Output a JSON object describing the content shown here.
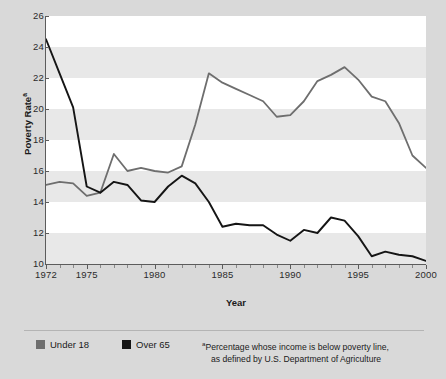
{
  "chart_data": {
    "type": "line",
    "title": "",
    "xlabel": "Year",
    "ylabel": "Poverty Rate",
    "ylabel_superscript": "a",
    "xlim": [
      1972,
      2000
    ],
    "ylim": [
      10,
      26
    ],
    "y_ticks": [
      26,
      24,
      22,
      20,
      18,
      16,
      14,
      12,
      10
    ],
    "x_ticks": [
      1972,
      1975,
      1980,
      1985,
      1990,
      1995,
      2000
    ],
    "x_minor_tick_interval": 1,
    "grid": "alternating-horizontal-bands",
    "legend_position": "bottom-left",
    "x": [
      1972,
      1973,
      1974,
      1975,
      1976,
      1977,
      1978,
      1979,
      1980,
      1981,
      1982,
      1983,
      1984,
      1985,
      1986,
      1987,
      1988,
      1989,
      1990,
      1991,
      1992,
      1993,
      1994,
      1995,
      1996,
      1997,
      1998,
      1999,
      2000
    ],
    "series": [
      {
        "name": "Under 18",
        "color": "#6e6e6e",
        "values": [
          15.1,
          15.3,
          15.2,
          14.4,
          14.6,
          17.1,
          16.0,
          16.2,
          16.0,
          15.9,
          16.3,
          19.0,
          22.3,
          21.7,
          21.3,
          20.9,
          20.5,
          19.5,
          19.6,
          20.5,
          21.8,
          22.2,
          22.7,
          21.9,
          20.8,
          20.5,
          19.1,
          17.0,
          16.2
        ]
      },
      {
        "name": "Over 65",
        "color": "#151515",
        "values": [
          24.5,
          22.3,
          20.1,
          15.0,
          14.6,
          15.3,
          15.1,
          14.1,
          14.0,
          15.0,
          15.7,
          15.2,
          14.0,
          12.4,
          12.6,
          12.5,
          12.5,
          11.9,
          11.5,
          12.2,
          12.0,
          13.0,
          12.8,
          11.8,
          10.5,
          10.8,
          10.6,
          10.5,
          10.2
        ]
      }
    ],
    "footnote": {
      "marker": "a",
      "line1": "Percentage whose income is below poverty line,",
      "line2": "as defined by U.S. Department of Agriculture"
    }
  },
  "axis": {
    "y_title": "Poverty Rate",
    "y_title_superscript": "a",
    "x_title": "Year",
    "y_tick_labels": [
      "26",
      "24",
      "22",
      "20",
      "18",
      "16",
      "14",
      "12",
      "10"
    ],
    "x_tick_labels": [
      "1972",
      "1975",
      "1980",
      "1985",
      "1990",
      "1995",
      "2000"
    ]
  },
  "legend": {
    "items": [
      {
        "label": "Under 18",
        "color": "#6e6e6e"
      },
      {
        "label": "Over 65",
        "color": "#151515"
      }
    ],
    "note_marker": "a",
    "note_line_1": "Percentage whose income is below poverty line,",
    "note_line_2": "as defined by U.S. Department of Agriculture"
  },
  "colors": {
    "page_background": "#d9d9d9",
    "plot_background": "#ffffff",
    "band": "#e8e8e8",
    "axis": "#5c5c5c",
    "text": "#1a1a1a",
    "under18": "#6e6e6e",
    "over65": "#151515"
  }
}
